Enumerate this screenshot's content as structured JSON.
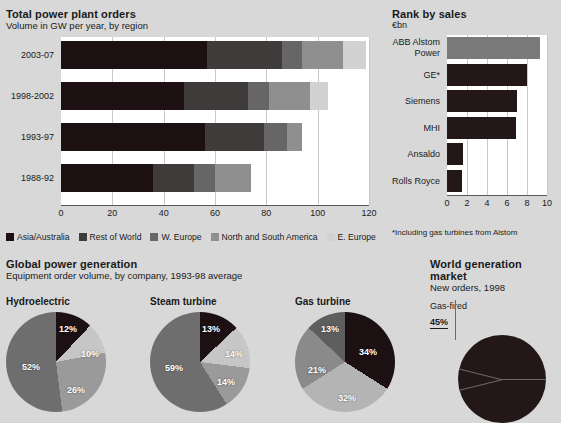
{
  "palette": {
    "bg": "#d8d8d8",
    "plot_bg": "#ffffff",
    "grid": "#c9c9c9",
    "s1_asia_australia": "#1c1012",
    "s2_rest_of_world": "#3f3b3b",
    "s3_w_europe": "#666666",
    "s4_north_south_america": "#8f8f8f",
    "s5_e_europe": "#d2d2d2",
    "rank_highlight": "#7a7a7a",
    "rank_dark": "#241718"
  },
  "total_power_plant_orders": {
    "title": "Total power plant orders",
    "subtitle": "Volume in GW per year, by region",
    "legend": [
      {
        "label": "Asia/Australia",
        "color": "#1c1012"
      },
      {
        "label": "Rest of World",
        "color": "#3f3b3b"
      },
      {
        "label": "W. Europe",
        "color": "#666666"
      },
      {
        "label": "North and South America",
        "color": "#8f8f8f"
      },
      {
        "label": "E. Europe",
        "color": "#d2d2d2"
      }
    ]
  },
  "rank_by_sales": {
    "title": "Rank by sales",
    "subtitle": "€bn",
    "footnote": "*Including gas turbines from Alstom"
  },
  "global_power_generation": {
    "title": "Global power generation",
    "subtitle": "Equipment order volume, by company, 1993-98 average"
  },
  "world_generation_market": {
    "title": "World generation market",
    "subtitle": "New orders, 1998",
    "callout_label": "Gas-fired",
    "callout_value": "45%"
  },
  "chart_data": [
    {
      "type": "bar",
      "id": "total-power-plant-orders",
      "orientation": "horizontal",
      "stacked": true,
      "title": "Total power plant orders",
      "subtitle": "Volume in GW per year, by region",
      "xlabel": "",
      "ylabel": "",
      "xlim": [
        0,
        120
      ],
      "xticks": [
        0,
        20,
        40,
        60,
        80,
        100,
        120
      ],
      "grid": true,
      "legend_position": "bottom",
      "categories": [
        "2003-07",
        "1998-2002",
        "1993-97",
        "1988-92"
      ],
      "series": [
        {
          "name": "Asia/Australia",
          "color": "#1c1012",
          "values": [
            57,
            48,
            56,
            36
          ]
        },
        {
          "name": "Rest of World",
          "color": "#3f3b3b",
          "values": [
            29,
            25,
            23,
            16
          ]
        },
        {
          "name": "W. Europe",
          "color": "#666666",
          "values": [
            8,
            8,
            9,
            8
          ]
        },
        {
          "name": "North and South America",
          "color": "#8f8f8f",
          "values": [
            16,
            16,
            6,
            14
          ]
        },
        {
          "name": "E. Europe",
          "color": "#d2d2d2",
          "values": [
            9,
            7,
            0,
            0
          ]
        }
      ],
      "totals": [
        119,
        104,
        94,
        74
      ]
    },
    {
      "type": "bar",
      "id": "rank-by-sales",
      "orientation": "horizontal",
      "title": "Rank by sales",
      "subtitle": "€bn",
      "unit": "€bn",
      "xlim": [
        0,
        10
      ],
      "xticks": [
        0,
        2,
        4,
        6,
        8,
        10
      ],
      "grid": true,
      "categories": [
        "ABB Alstom Power",
        "GE*",
        "Siemens",
        "MHI",
        "Ansaldo",
        "Rolls Royce"
      ],
      "values": [
        9.3,
        8.0,
        7.0,
        6.9,
        1.6,
        1.5
      ],
      "colors": [
        "#7a7a7a",
        "#241718",
        "#241718",
        "#241718",
        "#241718",
        "#241718"
      ],
      "footnote": "*Including gas turbines from Alstom"
    },
    {
      "type": "pie",
      "id": "hydroelectric",
      "title": "Hydroelectric",
      "group_title": "Global power generation",
      "group_subtitle": "Equipment order volume, by company, 1993-98 average",
      "labels": [
        "12%",
        "10%",
        "26%",
        "52%"
      ],
      "values": [
        12,
        10,
        26,
        52
      ],
      "colors": [
        "#1c1012",
        "#c6c6c6",
        "#9a9a9a",
        "#6e6e6e"
      ]
    },
    {
      "type": "pie",
      "id": "steam-turbine",
      "title": "Steam turbine",
      "labels": [
        "13%",
        "14%",
        "14%",
        "59%"
      ],
      "values": [
        13,
        14,
        14,
        59
      ],
      "colors": [
        "#1c1012",
        "#c6c6c6",
        "#9a9a9a",
        "#6e6e6e"
      ]
    },
    {
      "type": "pie",
      "id": "gas-turbine",
      "title": "Gas turbine",
      "labels": [
        "34%",
        "32%",
        "21%",
        "13%"
      ],
      "values": [
        34,
        32,
        21,
        13
      ],
      "colors": [
        "#1c1012",
        "#b4b4b4",
        "#8a8a8a",
        "#5e5e5e"
      ]
    },
    {
      "type": "pie",
      "id": "world-generation-market",
      "title": "World generation market",
      "subtitle": "New orders, 1998",
      "labels": [
        "45%",
        "",
        ""
      ],
      "values": [
        45,
        22,
        33
      ],
      "colors": [
        "#241718",
        "#241718",
        "#241718"
      ],
      "annotations": [
        {
          "label": "Gas-fired",
          "value": "45%"
        }
      ]
    }
  ]
}
